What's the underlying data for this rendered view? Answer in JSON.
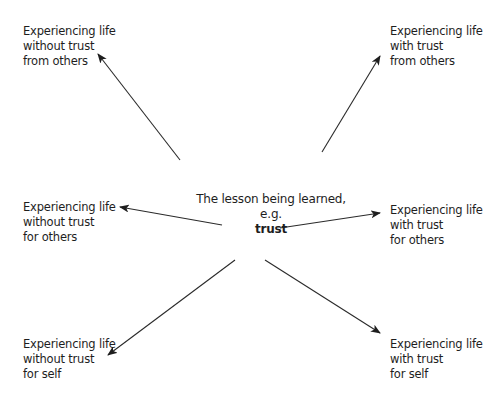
{
  "center": {
    "line1": "The lesson being learned,",
    "line2": "e.g.",
    "keyword": "trust"
  },
  "nodes": {
    "top_left": {
      "line1": "Experiencing life",
      "line2": "without trust",
      "line3": "from others"
    },
    "top_right": {
      "line1": "Experiencing life",
      "line2": "with trust",
      "line3": "from others"
    },
    "mid_left": {
      "line1": "Experiencing life",
      "line2": "without trust",
      "line3": "for others"
    },
    "mid_right": {
      "line1": "Experiencing life",
      "line2": "with trust",
      "line3": "for others"
    },
    "bottom_left": {
      "line1": "Experiencing life",
      "line2": "without trust",
      "line3": "for self"
    },
    "bottom_right": {
      "line1": "Experiencing life",
      "line2": "with trust",
      "line3": "for self"
    }
  },
  "colors": {
    "line": "#2a2a2a",
    "text": "#1e1e1e",
    "background": "#ffffff"
  }
}
